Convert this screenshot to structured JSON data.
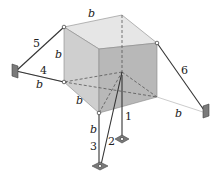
{
  "figure": {
    "type": "rigid-block-support-diagram",
    "side_label": "b",
    "links": [
      {
        "id": "1",
        "label": "1"
      },
      {
        "id": "2",
        "label": "2"
      },
      {
        "id": "3",
        "label": "3"
      },
      {
        "id": "4",
        "label": "4"
      },
      {
        "id": "5",
        "label": "5"
      },
      {
        "id": "6",
        "label": "6"
      }
    ],
    "dimension_labels": [
      "b",
      "b",
      "b",
      "b",
      "b",
      "b",
      "b",
      "b"
    ],
    "colors": {
      "top_face": "#e6e6e6",
      "left_face": "#c9c9c9",
      "front_face": "#b3b3b3",
      "link": "#333333",
      "anchor": "#7a7a7a"
    }
  }
}
